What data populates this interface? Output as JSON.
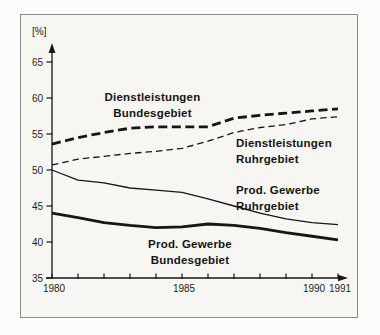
{
  "figure": {
    "unit_label": "[%]",
    "labels": {
      "dl_bund": {
        "line1": "Dienstleistungen",
        "line2": "Bundesgebiet"
      },
      "dl_ruhr": {
        "line1": "Dienstleistungen",
        "line2": "Ruhrgebiet"
      },
      "pg_ruhr": {
        "line1": "Prod. Gewerbe",
        "line2": "Ruhrgebiet"
      },
      "pg_bund": {
        "line1": "Prod. Gewerbe",
        "line2": "Bundesgebiet"
      }
    },
    "colors": {
      "ink": "#161616",
      "frame_border": "#8e8b85",
      "paper": "#f7f6f2"
    }
  },
  "chart_data": {
    "type": "line",
    "x": [
      1980,
      1981,
      1982,
      1983,
      1984,
      1985,
      1986,
      1987,
      1988,
      1989,
      1990,
      1991
    ],
    "series": [
      {
        "id": "dl_bund",
        "name": "Dienstleistungen Bundesgebiet",
        "style": "thick-dashed",
        "values": [
          53.6,
          54.5,
          55.2,
          55.8,
          56.0,
          56.0,
          56.0,
          57.2,
          57.6,
          57.9,
          58.2,
          58.5
        ]
      },
      {
        "id": "dl_ruhr",
        "name": "Dienstleistungen Ruhrgebiet",
        "style": "thin-dashed",
        "values": [
          50.7,
          51.5,
          51.9,
          52.3,
          52.6,
          53.0,
          54.0,
          55.2,
          55.9,
          56.3,
          57.1,
          57.4
        ]
      },
      {
        "id": "pg_ruhr",
        "name": "Prod. Gewerbe Ruhrgebiet",
        "style": "thin-solid",
        "values": [
          50.0,
          48.6,
          48.2,
          47.5,
          47.2,
          46.9,
          46.0,
          45.0,
          44.0,
          43.2,
          42.7,
          42.4
        ]
      },
      {
        "id": "pg_bund",
        "name": "Prod. Gewerbe Bundesgebiet",
        "style": "thick-solid",
        "values": [
          44.0,
          43.4,
          42.7,
          42.3,
          42.0,
          42.1,
          42.5,
          42.3,
          41.9,
          41.3,
          40.8,
          40.3
        ]
      }
    ],
    "ylabel": "[%]",
    "ylim": [
      35,
      67
    ],
    "y_ticks": [
      65,
      60,
      55,
      50,
      45,
      40,
      35
    ],
    "x_ticks": [
      1980,
      1981,
      1982,
      1983,
      1984,
      1985,
      1986,
      1987,
      1988,
      1989,
      1990,
      1991
    ],
    "x_labeled_ticks": [
      1980,
      1985,
      1990,
      1991
    ],
    "grid": false,
    "legend": "inline-labels"
  }
}
